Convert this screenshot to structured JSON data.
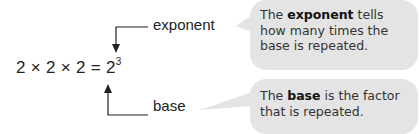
{
  "equation": {
    "base_text": "2 × 2 × 2 = 2",
    "exponent": "3"
  },
  "labels": {
    "exponent": "exponent",
    "base": "base"
  },
  "bubbles": [
    {
      "pre": "The ",
      "bold": "exponent",
      "post": " tells how many times the base is repeated."
    },
    {
      "pre": "The ",
      "bold": "base",
      "post": " is the factor that is repeated."
    }
  ],
  "colors": {
    "bubble": "#e4e4e4",
    "text": "#222222"
  }
}
